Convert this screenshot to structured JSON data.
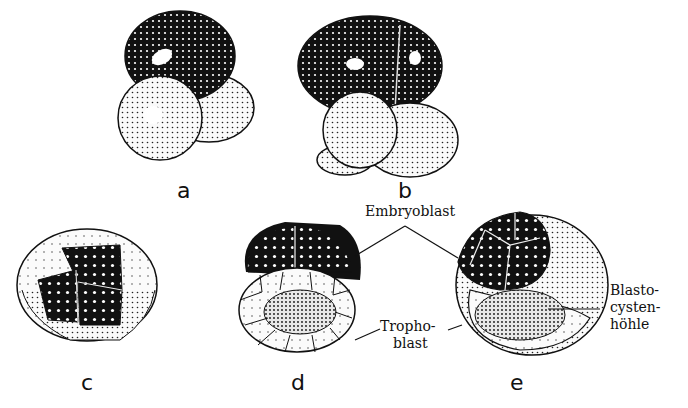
{
  "figure": {
    "panels": [
      {
        "id": "a",
        "letter": "a",
        "description": "2-cell stage"
      },
      {
        "id": "b",
        "letter": "b",
        "description": "4-cell stage"
      },
      {
        "id": "c",
        "letter": "c",
        "description": "morula"
      },
      {
        "id": "d",
        "letter": "d",
        "description": "early blastocyst section"
      },
      {
        "id": "e",
        "letter": "e",
        "description": "blastocyst"
      }
    ],
    "labels": {
      "embryoblast": "Embryoblast",
      "trophoblast_line1": "Tropho-",
      "trophoblast_line2": "blast",
      "blastocyst_line1": "Blasto-",
      "blastocyst_line2": "cysten-",
      "blastocyst_line3": "höhle"
    },
    "colors": {
      "ink": "#111111",
      "light_cell": "#f2f2f2",
      "background": "#ffffff"
    }
  }
}
